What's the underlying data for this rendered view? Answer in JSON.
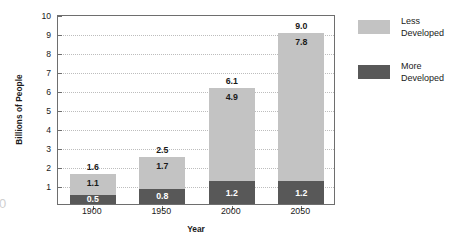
{
  "chart_data": {
    "type": "bar",
    "subtype": "stacked-vertical",
    "title": "",
    "xlabel": "Year",
    "ylabel": "Billions of People",
    "categories": [
      "1900",
      "1950",
      "2000",
      "2050"
    ],
    "series": [
      {
        "name": "More Developed",
        "color": "#585858",
        "values": [
          0.5,
          0.8,
          1.2,
          1.2
        ]
      },
      {
        "name": "Less Developed",
        "color": "#c3c3c3",
        "values": [
          1.1,
          1.7,
          4.9,
          7.8
        ]
      }
    ],
    "totals": [
      "1.6",
      "2.5",
      "6.1",
      "9.0"
    ],
    "bar_labels": {
      "1900": {
        "more": "0.5",
        "less": "1.1",
        "total": "1.6"
      },
      "1950": {
        "more": "0.8",
        "less": "1.7",
        "total": "2.5"
      },
      "2000": {
        "more": "1.2",
        "less": "4.9",
        "total": "6.1"
      },
      "2050": {
        "more": "1.2",
        "less": "7.8",
        "total": "9.0"
      }
    },
    "ylim": [
      0,
      10
    ],
    "yticks": [
      "1",
      "2",
      "3",
      "4",
      "5",
      "6",
      "7",
      "8",
      "9",
      "10"
    ],
    "grid": true,
    "grid_style": "dotted",
    "legend_position": "right"
  },
  "legend": {
    "entries": [
      {
        "label": "Less\nDeveloped",
        "color": "#c3c3c3",
        "name": "less-developed"
      },
      {
        "label": "More\nDeveloped",
        "color": "#585858",
        "name": "more-developed"
      }
    ]
  },
  "artifact": {
    "page_glyph": "0"
  }
}
